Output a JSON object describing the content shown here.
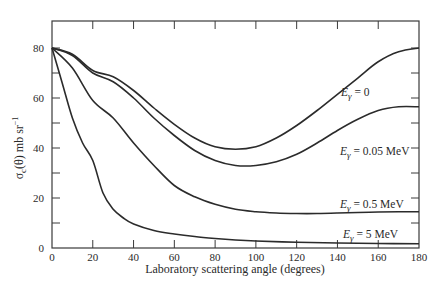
{
  "chart_data": {
    "type": "line",
    "title": "",
    "xlabel": "Laboratory scattering angle (degrees)",
    "ylabel": "σc(θ) mb sr⁻¹",
    "ylabel_parts": {
      "sym": "σ",
      "sub": "c",
      "arg": "(θ) mb sr",
      "sup": "−1"
    },
    "xlim": [
      0,
      180
    ],
    "ylim": [
      0,
      80
    ],
    "xticks": [
      0,
      20,
      40,
      60,
      80,
      100,
      120,
      140,
      160,
      180
    ],
    "yticks": [
      0,
      20,
      40,
      60,
      80
    ],
    "yminor": [
      10,
      30,
      50,
      70
    ],
    "grid": false,
    "legend": "inline labels at right",
    "series": [
      {
        "name": "Eγ = 0",
        "label": {
          "sym": "E",
          "sub": "γ",
          "rest": " = 0",
          "x": 341,
          "y": 96
        },
        "x": [
          0,
          10,
          20,
          30,
          40,
          50,
          60,
          70,
          80,
          90,
          100,
          110,
          120,
          130,
          140,
          150,
          160,
          170,
          180
        ],
        "values": [
          80,
          77.5,
          71,
          68.5,
          63,
          56,
          49.5,
          44,
          40.5,
          39.5,
          40.5,
          44,
          49,
          55,
          61.5,
          68,
          74.5,
          78.5,
          80
        ]
      },
      {
        "name": "Eγ = 0.05 MeV",
        "label": {
          "sym": "E",
          "sub": "γ",
          "rest": " = 0.05 MeV",
          "x": 340,
          "y": 155
        },
        "x": [
          0,
          10,
          20,
          30,
          40,
          50,
          60,
          70,
          80,
          90,
          100,
          110,
          120,
          130,
          140,
          150,
          160,
          170,
          180
        ],
        "values": [
          80,
          77,
          70,
          66.5,
          60,
          52,
          45,
          39,
          35,
          33,
          33,
          34.5,
          37.5,
          42,
          47,
          51.5,
          55,
          56.5,
          56.5
        ]
      },
      {
        "name": "Eγ = 0.5 MeV",
        "label": {
          "sym": "E",
          "sub": "γ",
          "rest": " = 0.5 MeV",
          "x": 340,
          "y": 208
        },
        "x": [
          0,
          10,
          20,
          30,
          40,
          50,
          60,
          70,
          80,
          90,
          100,
          110,
          120,
          130,
          140,
          150,
          160,
          170,
          180
        ],
        "values": [
          80,
          72,
          59,
          52,
          42,
          33,
          25,
          20.5,
          17.5,
          15.5,
          14.5,
          14,
          13.8,
          13.8,
          14,
          14.2,
          14.4,
          14.5,
          14.5
        ]
      },
      {
        "name": "Eγ = 5 MeV",
        "label": {
          "sym": "E",
          "sub": "γ",
          "rest": " = 5 MeV",
          "x": 343,
          "y": 238
        },
        "x": [
          0,
          5,
          10,
          15,
          20,
          25,
          30,
          35,
          40,
          50,
          60,
          70,
          80,
          90,
          100,
          120,
          140,
          160,
          180
        ],
        "values": [
          80,
          66,
          52,
          42,
          35,
          22,
          15.5,
          12,
          9.6,
          7,
          5.6,
          4.6,
          3.8,
          3.2,
          2.8,
          2.3,
          2,
          1.8,
          1.7
        ]
      }
    ]
  },
  "colors": {
    "line": "#2b2b2b",
    "axis": "#3a3a3a",
    "text": "#2a2a2a",
    "background": "#ffffff"
  }
}
